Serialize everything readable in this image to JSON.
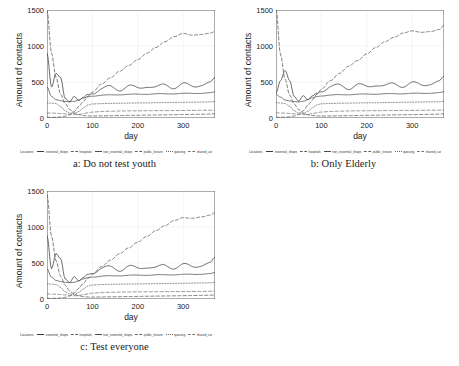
{
  "figure": {
    "axis": {
      "ylabel": "Amount of contacts",
      "xlabel": "day",
      "yticks": [
        "0",
        "500",
        "1000",
        "1500"
      ],
      "xticks": [
        "0",
        "100",
        "200",
        "300"
      ]
    },
    "legend": {
      "title": "Locations",
      "items": [
        {
          "label": "essential_shops",
          "style": "solid",
          "color": "#3c3c3c"
        },
        {
          "label": "hospitals",
          "style": "dashed",
          "color": "#555555"
        },
        {
          "label": "non_essential_shops",
          "style": "solid",
          "color": "#4a4a4a"
        },
        {
          "label": "public_leisure",
          "style": "dashed",
          "color": "#5a5a5a"
        },
        {
          "label": "queuing",
          "style": "dotted",
          "color": "#666666"
        },
        {
          "label": "shared_car",
          "style": "dashed",
          "color": "#707070"
        }
      ]
    },
    "panels": [
      {
        "id": "a",
        "caption": "a: Do not test youth"
      },
      {
        "id": "b",
        "caption": "b: Only Elderly"
      },
      {
        "id": "c",
        "caption": "c: Test everyone"
      }
    ]
  },
  "chart_data": [
    {
      "type": "line",
      "title": "a: Do not test youth",
      "xlabel": "day",
      "ylabel": "Amount of contacts",
      "xlim": [
        0,
        370
      ],
      "ylim": [
        0,
        1500
      ],
      "grid": true,
      "legend_position": "below",
      "x": [
        0,
        10,
        20,
        30,
        40,
        50,
        60,
        70,
        80,
        90,
        100,
        120,
        140,
        160,
        180,
        200,
        220,
        240,
        260,
        280,
        300,
        320,
        340,
        360,
        370
      ],
      "series": [
        {
          "name": "essential_shops",
          "style": "solid",
          "values": [
            900,
            430,
            620,
            560,
            270,
            225,
            300,
            240,
            280,
            330,
            350,
            400,
            430,
            400,
            440,
            410,
            450,
            420,
            460,
            430,
            465,
            440,
            470,
            480,
            540
          ]
        },
        {
          "name": "hospitals",
          "style": "dashed",
          "values": [
            1500,
            900,
            560,
            330,
            200,
            120,
            70,
            45,
            35,
            30,
            28,
            30,
            32,
            34,
            36,
            38,
            40,
            42,
            44,
            46,
            48,
            50,
            52,
            55,
            58
          ]
        },
        {
          "name": "non_essential_shops",
          "style": "solid",
          "values": [
            430,
            300,
            255,
            240,
            230,
            225,
            230,
            250,
            275,
            295,
            305,
            315,
            320,
            325,
            328,
            330,
            332,
            334,
            336,
            338,
            340,
            342,
            345,
            348,
            360
          ]
        },
        {
          "name": "public_leisure",
          "style": "dashed",
          "values": [
            10,
            8,
            10,
            15,
            25,
            45,
            90,
            160,
            230,
            300,
            360,
            470,
            560,
            650,
            730,
            810,
            900,
            980,
            1060,
            1130,
            1175,
            1150,
            1160,
            1180,
            1200
          ]
        },
        {
          "name": "queuing",
          "style": "dotted",
          "values": [
            210,
            205,
            200,
            160,
            100,
            70,
            60,
            90,
            140,
            180,
            195,
            200,
            203,
            205,
            207,
            209,
            210,
            212,
            214,
            216,
            218,
            220,
            222,
            224,
            230
          ]
        },
        {
          "name": "shared_car",
          "style": "dashed",
          "values": [
            70,
            68,
            66,
            62,
            58,
            52,
            46,
            50,
            60,
            72,
            82,
            90,
            94,
            97,
            99,
            100,
            101,
            102,
            103,
            104,
            105,
            106,
            107,
            108,
            110
          ]
        }
      ]
    },
    {
      "type": "line",
      "title": "b: Only Elderly",
      "xlabel": "day",
      "ylabel": "Amount of contacts",
      "xlim": [
        0,
        370
      ],
      "ylim": [
        0,
        1500
      ],
      "grid": true,
      "legend_position": "below",
      "x": [
        0,
        10,
        20,
        30,
        40,
        50,
        60,
        70,
        80,
        90,
        100,
        120,
        140,
        160,
        180,
        200,
        220,
        240,
        260,
        280,
        300,
        320,
        340,
        360,
        370
      ],
      "series": [
        {
          "name": "essential_shops",
          "style": "solid",
          "values": [
            350,
            520,
            660,
            520,
            300,
            235,
            310,
            250,
            300,
            345,
            380,
            430,
            450,
            420,
            460,
            430,
            470,
            440,
            475,
            450,
            480,
            460,
            485,
            495,
            560
          ]
        },
        {
          "name": "hospitals",
          "style": "dashed",
          "values": [
            1520,
            880,
            540,
            320,
            195,
            115,
            68,
            44,
            34,
            29,
            27,
            29,
            31,
            33,
            35,
            37,
            39,
            41,
            43,
            45,
            47,
            49,
            51,
            54,
            57
          ]
        },
        {
          "name": "non_essential_shops",
          "style": "solid",
          "values": [
            330,
            290,
            250,
            238,
            228,
            224,
            232,
            255,
            280,
            298,
            308,
            318,
            322,
            326,
            329,
            331,
            333,
            335,
            337,
            339,
            341,
            343,
            346,
            349,
            362
          ]
        },
        {
          "name": "public_leisure",
          "style": "dashed",
          "values": [
            12,
            9,
            11,
            16,
            28,
            50,
            100,
            175,
            250,
            330,
            400,
            520,
            620,
            720,
            800,
            890,
            980,
            1060,
            1120,
            1180,
            1210,
            1190,
            1200,
            1230,
            1290
          ]
        },
        {
          "name": "queuing",
          "style": "dotted",
          "values": [
            215,
            208,
            202,
            162,
            102,
            72,
            62,
            92,
            142,
            182,
            197,
            202,
            205,
            207,
            209,
            211,
            212,
            214,
            216,
            218,
            220,
            222,
            224,
            226,
            232
          ]
        },
        {
          "name": "shared_car",
          "style": "dashed",
          "values": [
            72,
            70,
            67,
            63,
            59,
            53,
            47,
            51,
            61,
            73,
            83,
            91,
            95,
            98,
            100,
            101,
            102,
            103,
            104,
            105,
            106,
            107,
            108,
            109,
            112
          ]
        }
      ]
    },
    {
      "type": "line",
      "title": "c: Test everyone",
      "xlabel": "day",
      "ylabel": "Amount of contacts",
      "xlim": [
        0,
        370
      ],
      "ylim": [
        0,
        1500
      ],
      "grid": true,
      "legend_position": "below",
      "x": [
        0,
        10,
        20,
        30,
        40,
        50,
        60,
        70,
        80,
        90,
        100,
        120,
        140,
        160,
        180,
        200,
        220,
        240,
        260,
        280,
        300,
        320,
        340,
        360,
        370
      ],
      "series": [
        {
          "name": "essential_shops",
          "style": "solid",
          "values": [
            880,
            420,
            630,
            560,
            280,
            230,
            310,
            250,
            290,
            345,
            370,
            420,
            440,
            410,
            450,
            420,
            455,
            430,
            465,
            440,
            470,
            450,
            478,
            488,
            560
          ]
        },
        {
          "name": "hospitals",
          "style": "dashed",
          "values": [
            1450,
            870,
            530,
            315,
            190,
            112,
            66,
            43,
            33,
            28,
            26,
            28,
            30,
            32,
            34,
            36,
            38,
            40,
            42,
            44,
            46,
            48,
            50,
            53,
            56
          ]
        },
        {
          "name": "non_essential_shops",
          "style": "solid",
          "values": [
            420,
            300,
            258,
            242,
            232,
            226,
            232,
            252,
            278,
            296,
            306,
            316,
            321,
            325,
            328,
            330,
            332,
            334,
            336,
            338,
            340,
            343,
            346,
            350,
            365
          ]
        },
        {
          "name": "public_leisure",
          "style": "dashed",
          "values": [
            10,
            8,
            10,
            14,
            24,
            42,
            85,
            150,
            215,
            285,
            345,
            450,
            540,
            630,
            710,
            790,
            870,
            950,
            1020,
            1090,
            1130,
            1120,
            1140,
            1165,
            1200
          ]
        },
        {
          "name": "queuing",
          "style": "dotted",
          "values": [
            212,
            206,
            201,
            160,
            100,
            70,
            60,
            90,
            140,
            180,
            195,
            201,
            204,
            206,
            208,
            210,
            211,
            213,
            215,
            217,
            219,
            221,
            223,
            225,
            231
          ]
        },
        {
          "name": "shared_car",
          "style": "dashed",
          "values": [
            70,
            68,
            66,
            62,
            57,
            51,
            45,
            49,
            59,
            71,
            81,
            89,
            93,
            96,
            98,
            99,
            100,
            101,
            102,
            103,
            104,
            105,
            106,
            107,
            110
          ]
        }
      ]
    }
  ]
}
